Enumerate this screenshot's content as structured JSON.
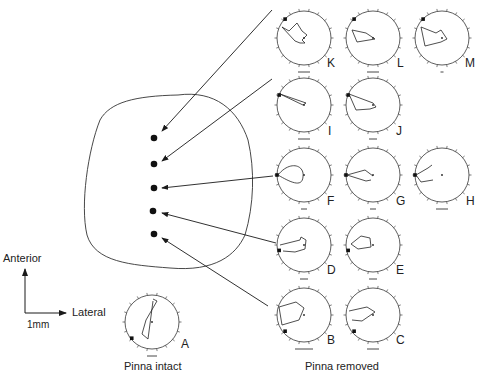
{
  "labels": {
    "anterior": "Anterior",
    "lateral": "Lateral",
    "scale": "1mm",
    "pinna_intact": "Pinna intact",
    "pinna_removed": "Pinna removed"
  },
  "panels": [
    {
      "id": "A",
      "group": "pinna_intact"
    },
    {
      "id": "B",
      "group": "pinna_removed"
    },
    {
      "id": "C",
      "group": "pinna_removed"
    },
    {
      "id": "D",
      "group": "pinna_removed"
    },
    {
      "id": "E",
      "group": "pinna_removed"
    },
    {
      "id": "F",
      "group": "pinna_removed"
    },
    {
      "id": "G",
      "group": "pinna_removed"
    },
    {
      "id": "H",
      "group": "pinna_removed"
    },
    {
      "id": "I",
      "group": "pinna_removed"
    },
    {
      "id": "J",
      "group": "pinna_removed"
    },
    {
      "id": "K",
      "group": "pinna_removed"
    },
    {
      "id": "L",
      "group": "pinna_removed"
    },
    {
      "id": "M",
      "group": "pinna_removed"
    }
  ],
  "recording_sites": 5,
  "colors": {
    "ink": "#1a1a1a",
    "background": "#ffffff"
  }
}
